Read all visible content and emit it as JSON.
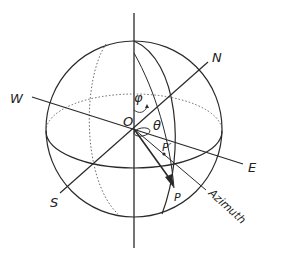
{
  "diagram": {
    "labels": {
      "west": "W",
      "east": "E",
      "north": "N",
      "south": "S",
      "origin": "O",
      "phi": "φ",
      "theta": "θ",
      "point": "P",
      "projection": "P′",
      "azimuth": "Azimuth"
    },
    "colors": {
      "line": "#2a2a2a",
      "background": "#ffffff"
    }
  }
}
